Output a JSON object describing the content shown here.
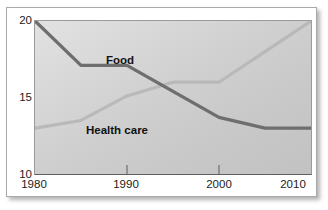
{
  "title": "",
  "chart_data": {
    "type": "line",
    "title": "",
    "subtitle": "",
    "xlabel": "",
    "ylabel": "",
    "xlim": [
      1980,
      2010
    ],
    "ylim": [
      10,
      20
    ],
    "grid": false,
    "legend_position": "inline-annotation",
    "x_ticks": [
      "1980",
      "1990",
      "2000",
      "2010"
    ],
    "x_tick_values": [
      1980,
      1990,
      2000,
      2010
    ],
    "y_ticks": [
      "10",
      "15",
      "20"
    ],
    "y_tick_values": [
      10,
      15,
      20
    ],
    "series": [
      {
        "name": "Food",
        "color": "#6e6e6e",
        "x": [
          1980,
          1985,
          1990,
          1995,
          2000,
          2005,
          2010
        ],
        "values": [
          20.0,
          17.1,
          17.1,
          15.4,
          13.7,
          13.0,
          13.0
        ]
      },
      {
        "name": "Health care",
        "color": "#b9b9b9",
        "x": [
          1980,
          1985,
          1990,
          1995,
          2000,
          2005,
          2010
        ],
        "values": [
          13.0,
          13.5,
          15.1,
          16.0,
          16.0,
          18.0,
          20.0
        ]
      }
    ],
    "annotations": [
      {
        "text": "Food",
        "x": 1991,
        "y": 17.8
      },
      {
        "text": "Health care",
        "x": 1988,
        "y": 13.3
      }
    ]
  },
  "axes": {
    "y_tick_20": "20",
    "y_tick_15": "15",
    "y_tick_10": "10",
    "x_tick_1980": "1980",
    "x_tick_1990": "1990",
    "x_tick_2000": "2000",
    "x_tick_2010": "2010"
  },
  "labels": {
    "food": "Food",
    "health_care": "Health care"
  },
  "colors": {
    "food_line": "#6e6e6e",
    "health_line": "#b9b9b9",
    "plot_background": "#d2d2d2",
    "axis": "#5f5f5f",
    "text": "#1b1b1b"
  }
}
